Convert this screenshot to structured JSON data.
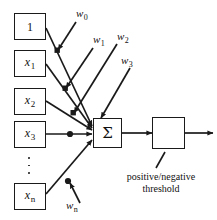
{
  "diagram": {
    "type": "neural-network-unit",
    "stroke_color": "#1a1a1a",
    "background_color": "#ffffff"
  },
  "inputs": [
    {
      "id": "bias",
      "label": "1",
      "subscript": "",
      "italic": false
    },
    {
      "id": "x1",
      "label": "x",
      "subscript": "1",
      "italic": true
    },
    {
      "id": "x2",
      "label": "x",
      "subscript": "2",
      "italic": true
    },
    {
      "id": "x3",
      "label": "x",
      "subscript": "3",
      "italic": true
    },
    {
      "id": "xn",
      "label": "x",
      "subscript": "n",
      "italic": true
    }
  ],
  "weights": [
    {
      "id": "w0",
      "label": "w",
      "subscript": "0"
    },
    {
      "id": "w1",
      "label": "w",
      "subscript": "1"
    },
    {
      "id": "w2",
      "label": "w",
      "subscript": "2"
    },
    {
      "id": "w3",
      "label": "w",
      "subscript": "3"
    },
    {
      "id": "wn",
      "label": "w",
      "subscript": "n"
    }
  ],
  "sum_node": {
    "symbol": "Σ",
    "name": "summation"
  },
  "threshold_node": {
    "icon": "step-function-icon",
    "name": "activation"
  },
  "caption": {
    "line1": "positive/negative",
    "line2": "threshold"
  },
  "ellipsis": {
    "symbol": "vertical-ellipsis",
    "dot_count": 3
  }
}
